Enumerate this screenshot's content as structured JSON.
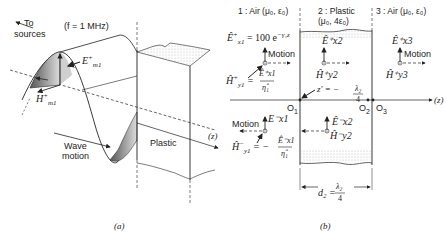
{
  "figure_a": {
    "caption": "(a)",
    "to_sources": "To",
    "to_sources_2": "sources",
    "frequency": "(f = 1 MHz)",
    "e_field": "E",
    "e_field_sub": "m1",
    "e_field_sup": "+",
    "h_field": "H",
    "h_field_sub": "m1",
    "h_field_sup": "+",
    "z_axis": "(z)",
    "wave_motion_1": "Wave",
    "wave_motion_2": "motion",
    "material": "Plastic"
  },
  "figure_b": {
    "caption": "(b)",
    "regions": [
      {
        "label": "1 : Air (μ₀, ε₀)"
      },
      {
        "label": "2 : Plastic",
        "label2": "(μ₀, 4ε₀)"
      },
      {
        "label": "3 : Air (μ₀, ε₀)"
      }
    ],
    "incident_e": "Ê⁺x1 = 100 e^(−γ₁z)",
    "incident_e_base": "Ê",
    "incident_e_rhs": "= 100 e",
    "incident_e_exp": "−γ₁z",
    "motion": "Motion",
    "hy1_plus_lhs": "Ĥ",
    "hy1_plus_rhs_num": "Ê⁺x1",
    "hy1_plus_rhs_den": "η̂₁",
    "hy1_minus_num": "Ê⁻x1",
    "hy1_minus_den": "η̂₁",
    "ex2_plus": "Ê⁺x2",
    "hy2_plus": "Ĥ⁺y2",
    "ex3_plus": "Ê⁺x3",
    "hy3_plus": "Ĥ⁺y3",
    "ex1_minus": "E⁻x1",
    "ex2_minus": "Ê⁻x2",
    "hy2_minus": "Ĥ⁻y2",
    "z_prime": "z' = −",
    "z_prime_num": "λ₂",
    "z_prime_den": "4",
    "origin_1": "O",
    "origin_2": "O",
    "origin_3": "O",
    "z_axis": "(z)",
    "thickness": "d₂ =",
    "thickness_num": "λ₂",
    "thickness_den": "4"
  }
}
